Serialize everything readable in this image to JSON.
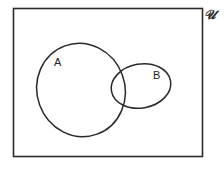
{
  "diagram": {
    "type": "venn",
    "universe_label": "𝒰",
    "sets": [
      {
        "id": "A",
        "label": "A"
      },
      {
        "id": "B",
        "label": "B"
      }
    ],
    "stroke_color": "#2a2a2a",
    "background": "#ffffff"
  }
}
